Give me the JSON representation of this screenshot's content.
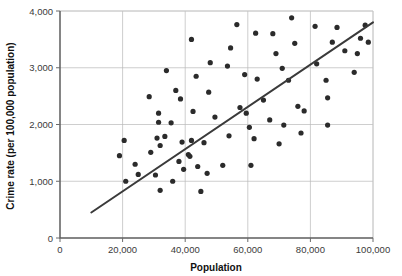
{
  "chart_data": {
    "type": "scatter",
    "title": "",
    "xlabel": "Population",
    "ylabel": "Crime rate (per 100,000 population)",
    "xlim": [
      0,
      100000
    ],
    "ylim": [
      0,
      4000
    ],
    "xticks": [
      0,
      20000,
      40000,
      60000,
      80000,
      100000
    ],
    "yticks": [
      0,
      1000,
      2000,
      3000,
      4000
    ],
    "xtick_labels": [
      "0",
      "20,000",
      "40,000",
      "60,000",
      "80,000",
      "100,000"
    ],
    "ytick_labels": [
      "0",
      "1,000",
      "2,000",
      "3,000",
      "4,000"
    ],
    "grid": true,
    "legend": null,
    "marker_color": "#2b2b2b",
    "trendline_color": "#3a3a3a",
    "trendline": {
      "type": "line",
      "x": [
        10000,
        100000
      ],
      "y": [
        450,
        3800
      ]
    },
    "points": [
      [
        19000,
        1450
      ],
      [
        20500,
        1720
      ],
      [
        21000,
        1000
      ],
      [
        24000,
        1300
      ],
      [
        25000,
        1120
      ],
      [
        28500,
        2490
      ],
      [
        29000,
        1510
      ],
      [
        30500,
        1110
      ],
      [
        31000,
        1760
      ],
      [
        31500,
        2040
      ],
      [
        31500,
        2200
      ],
      [
        32000,
        1630
      ],
      [
        32000,
        840
      ],
      [
        33500,
        1790
      ],
      [
        34000,
        2950
      ],
      [
        35500,
        2030
      ],
      [
        36000,
        1000
      ],
      [
        37000,
        2600
      ],
      [
        38000,
        1350
      ],
      [
        38500,
        2450
      ],
      [
        39000,
        1690
      ],
      [
        39500,
        1210
      ],
      [
        41000,
        1470
      ],
      [
        41500,
        1440
      ],
      [
        42000,
        1720
      ],
      [
        42000,
        3500
      ],
      [
        42500,
        2230
      ],
      [
        43500,
        2850
      ],
      [
        44000,
        1260
      ],
      [
        45000,
        820
      ],
      [
        46000,
        1680
      ],
      [
        47000,
        1140
      ],
      [
        47500,
        2570
      ],
      [
        48000,
        3090
      ],
      [
        49500,
        2130
      ],
      [
        52000,
        1280
      ],
      [
        53500,
        3030
      ],
      [
        54000,
        1800
      ],
      [
        54500,
        3350
      ],
      [
        56500,
        3760
      ],
      [
        57500,
        2300
      ],
      [
        59000,
        2880
      ],
      [
        59500,
        2200
      ],
      [
        60500,
        1950
      ],
      [
        61000,
        1280
      ],
      [
        62000,
        1750
      ],
      [
        62500,
        3610
      ],
      [
        63000,
        2800
      ],
      [
        65000,
        2430
      ],
      [
        67000,
        2080
      ],
      [
        68000,
        3600
      ],
      [
        69000,
        3250
      ],
      [
        70000,
        1660
      ],
      [
        71000,
        2990
      ],
      [
        71500,
        1990
      ],
      [
        73000,
        2780
      ],
      [
        74000,
        3880
      ],
      [
        75000,
        3430
      ],
      [
        76000,
        2320
      ],
      [
        77000,
        1850
      ],
      [
        78000,
        2240
      ],
      [
        81500,
        3730
      ],
      [
        82000,
        3070
      ],
      [
        85000,
        2780
      ],
      [
        85500,
        2470
      ],
      [
        85500,
        1990
      ],
      [
        87000,
        3450
      ],
      [
        88500,
        3710
      ],
      [
        91000,
        3300
      ],
      [
        94000,
        2920
      ],
      [
        95000,
        3250
      ],
      [
        96000,
        3520
      ],
      [
        97500,
        3750
      ],
      [
        98500,
        3450
      ]
    ]
  }
}
